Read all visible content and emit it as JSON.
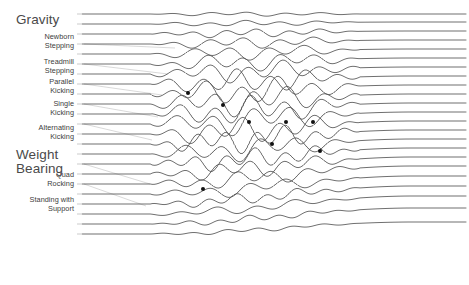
{
  "chart_data": {
    "type": "area",
    "title": "",
    "subtitle": "",
    "xlabel": "",
    "ylabel": "",
    "grid": false,
    "legend_position": "left",
    "axis_style": "stacked-stream-lines",
    "xlim": [
      0,
      469
    ],
    "ylim": [
      0,
      285
    ],
    "plot_area": {
      "x": 82,
      "y": 4,
      "width": 385,
      "height": 276
    },
    "baseline_count": 23,
    "groups": [
      {
        "name": "Gravity",
        "header_y": 13,
        "series": [
          {
            "label": "Newborn\nStepping",
            "label_y": 33,
            "lane": 3,
            "leader_to_x": 175,
            "leader_to_y": 48
          },
          {
            "label": "Treadmill\nStepping",
            "label_y": 58,
            "lane": 5,
            "leader_to_x": 168,
            "leader_to_y": 74
          },
          {
            "label": "Parallel\nKicking",
            "label_y": 78,
            "lane": 7,
            "leader_to_x": 162,
            "leader_to_y": 95
          },
          {
            "label": "Single\nKicking",
            "label_y": 100,
            "lane": 9,
            "leader_to_x": 158,
            "leader_to_y": 117
          },
          {
            "label": "Alternating\nKicking",
            "label_y": 124,
            "lane": 11,
            "leader_to_x": 152,
            "leader_to_y": 140
          }
        ]
      },
      {
        "name": "Weight\nBearing",
        "header_y": 148,
        "series": [
          {
            "label": "Quad\nRocking",
            "label_y": 171,
            "lane": 15,
            "leader_to_x": 150,
            "leader_to_y": 184
          },
          {
            "label": "Standing with\nSupport",
            "label_y": 196,
            "lane": 17,
            "leader_to_x": 146,
            "leader_to_y": 206
          }
        ]
      }
    ],
    "lane_baselines": [
      {
        "index": 0,
        "y_left": 14,
        "y_right": 14,
        "amp": 0.15
      },
      {
        "index": 1,
        "y_left": 24,
        "y_right": 22,
        "amp": 0.2
      },
      {
        "index": 2,
        "y_left": 34,
        "y_right": 31,
        "amp": 0.3
      },
      {
        "index": 3,
        "y_left": 44,
        "y_right": 40,
        "amp": 0.4
      },
      {
        "index": 4,
        "y_left": 54,
        "y_right": 49,
        "amp": 0.5
      },
      {
        "index": 5,
        "y_left": 64,
        "y_right": 58,
        "amp": 0.62
      },
      {
        "index": 6,
        "y_left": 74,
        "y_right": 67,
        "amp": 0.74
      },
      {
        "index": 7,
        "y_left": 84,
        "y_right": 76,
        "amp": 0.86
      },
      {
        "index": 8,
        "y_left": 94,
        "y_right": 85,
        "amp": 0.95
      },
      {
        "index": 9,
        "y_left": 104,
        "y_right": 94,
        "amp": 1.0
      },
      {
        "index": 10,
        "y_left": 114,
        "y_right": 103,
        "amp": 1.0
      },
      {
        "index": 11,
        "y_left": 124,
        "y_right": 112,
        "amp": 0.98
      },
      {
        "index": 12,
        "y_left": 134,
        "y_right": 121,
        "amp": 0.94
      },
      {
        "index": 13,
        "y_left": 144,
        "y_right": 130,
        "amp": 0.88
      },
      {
        "index": 14,
        "y_left": 154,
        "y_right": 139,
        "amp": 0.8
      },
      {
        "index": 15,
        "y_left": 164,
        "y_right": 148,
        "amp": 0.72
      },
      {
        "index": 16,
        "y_left": 174,
        "y_right": 157,
        "amp": 0.64
      },
      {
        "index": 17,
        "y_left": 184,
        "y_right": 166,
        "amp": 0.56
      },
      {
        "index": 18,
        "y_left": 194,
        "y_right": 176,
        "amp": 0.48
      },
      {
        "index": 19,
        "y_left": 204,
        "y_right": 186,
        "amp": 0.4
      },
      {
        "index": 20,
        "y_left": 214,
        "y_right": 196,
        "amp": 0.32
      },
      {
        "index": 21,
        "y_left": 224,
        "y_right": 208,
        "amp": 0.24
      },
      {
        "index": 22,
        "y_left": 234,
        "y_right": 222,
        "amp": 0.16
      }
    ],
    "markers": [
      {
        "x": 188,
        "y": 93,
        "r": 2.0
      },
      {
        "x": 223,
        "y": 105,
        "r": 2.0
      },
      {
        "x": 249,
        "y": 122,
        "r": 2.0
      },
      {
        "x": 272,
        "y": 144,
        "r": 2.0
      },
      {
        "x": 286,
        "y": 122,
        "r": 2.0
      },
      {
        "x": 313,
        "y": 122,
        "r": 2.0
      },
      {
        "x": 320,
        "y": 151,
        "r": 2.0
      },
      {
        "x": 203,
        "y": 189,
        "r": 2.0
      }
    ],
    "colors": {
      "line": "#555555",
      "marker": "#111111",
      "label_text": "#3c3c3c",
      "header_text": "#4a4a4a",
      "leader": "#c8c8c8",
      "tick": "#b4b4b4",
      "background": "#ffffff"
    },
    "wave": {
      "turbulence_start_x": 150,
      "turbulence_end_x": 360,
      "period_px": 34,
      "max_amplitude_px": 13
    }
  }
}
